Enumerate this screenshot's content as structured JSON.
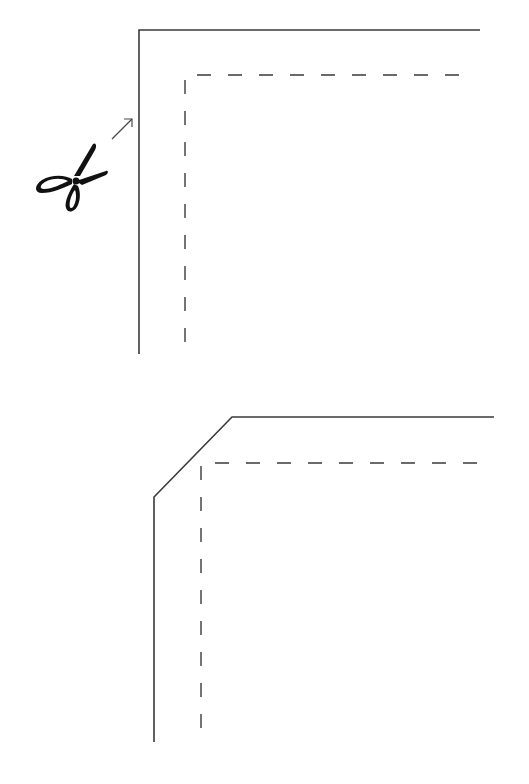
{
  "figure": {
    "colors": {
      "line": "#3a3a3a",
      "scissors": "#111111",
      "background": "#ffffff"
    },
    "panels": [
      {
        "id": "before-trim",
        "cut_edge": "solid square corner",
        "seam_line": "dashed square corner",
        "icon": "scissors-icon",
        "annotation": "arrow pointing to corner"
      },
      {
        "id": "after-trim",
        "cut_edge": "solid corner with diagonal clip",
        "seam_line": "dashed square corner"
      }
    ]
  }
}
